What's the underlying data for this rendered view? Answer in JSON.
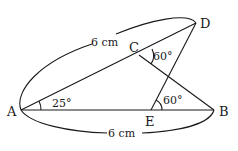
{
  "diagram": {
    "points": {
      "A": {
        "label": "A",
        "x": 21,
        "y": 110
      },
      "B": {
        "label": "B",
        "x": 214,
        "y": 110
      },
      "C": {
        "label": "C",
        "x": 139,
        "y": 55
      },
      "D": {
        "label": "D",
        "x": 196,
        "y": 23
      },
      "E": {
        "label": "E",
        "x": 151,
        "y": 110
      }
    },
    "segments": [
      "AD",
      "AB",
      "CB",
      "ED"
    ],
    "angles": {
      "A": {
        "value": "25°",
        "between": "AB, AD"
      },
      "C": {
        "value": "60°",
        "between": "CD, CB"
      },
      "E": {
        "value": "60°",
        "between": "ED, EB"
      }
    },
    "lengths": {
      "AD": {
        "value": "6 cm"
      },
      "AB": {
        "value": "6 cm"
      }
    }
  }
}
